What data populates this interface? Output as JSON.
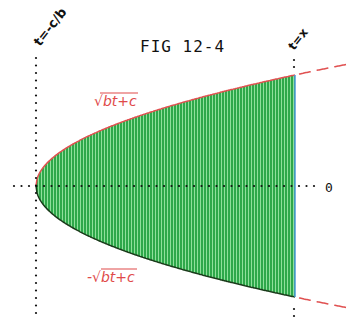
{
  "figure": {
    "title": "FIG 12-4",
    "left_bound_label": "t=-c/b",
    "right_bound_label": "t=x",
    "axis_label": "0",
    "upper_curve_label": "√bt+c",
    "lower_curve_label": "-√bt+c"
  },
  "colors": {
    "fill": "#2ea84a",
    "fill_stripe": "#8fe09b",
    "curve": "#e05050",
    "curve_edge_lower": "#1a3a1a",
    "right_edge": "#4a9ad8",
    "dots": "#111111",
    "text": "#111111",
    "label": "#e04a4a"
  },
  "geometry": {
    "vertex_x": 36,
    "axis_y": 186,
    "right_x": 295,
    "k": 6.9,
    "dash_end_x": 350
  }
}
